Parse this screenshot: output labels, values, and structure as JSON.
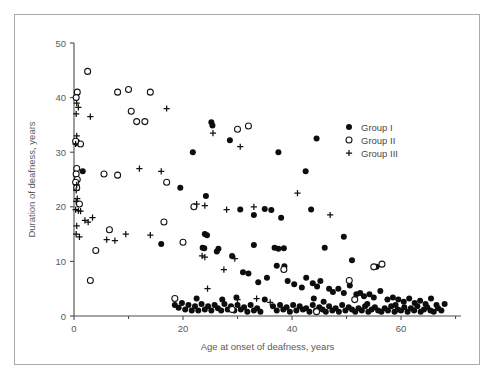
{
  "figure": {
    "background": "#ffffff",
    "frame_color": "#aaaaaa",
    "axis_color": "#4c4c4c",
    "marker_color": "#0d0d0d"
  },
  "legend": {
    "position": "top-right-inside",
    "entries": [
      {
        "label": "Group I",
        "marker": "filled-circle-icon"
      },
      {
        "label": "Group II",
        "marker": "open-circle-icon"
      },
      {
        "label": "Group III",
        "marker": "plus-icon"
      }
    ]
  },
  "chart_data": {
    "type": "scatter",
    "title": "",
    "xlabel": "Age at onset of deafness, years",
    "ylabel": "Duration of deafness, years",
    "xlim": [
      0,
      71
    ],
    "ylim": [
      0,
      50
    ],
    "xticks": [
      0,
      20,
      40,
      60
    ],
    "xticks_minor": [
      10,
      30,
      50,
      70
    ],
    "yticks": [
      0,
      10,
      20,
      30,
      40,
      50
    ],
    "grid": false,
    "legend": [
      "Group I",
      "Group II",
      "Group III"
    ],
    "series": [
      {
        "name": "Group I",
        "marker": "filled-circle",
        "points": [
          [
            1.6,
            26.5
          ],
          [
            16.0,
            13.2
          ],
          [
            21.8,
            30.0
          ],
          [
            19.5,
            23.5
          ],
          [
            25.2,
            35.5
          ],
          [
            25.4,
            34.9
          ],
          [
            28.6,
            32.2
          ],
          [
            37.5,
            30.0
          ],
          [
            44.5,
            32.5
          ],
          [
            42.5,
            26.5
          ],
          [
            24.2,
            22.0
          ],
          [
            30.5,
            19.5
          ],
          [
            33.0,
            18.5
          ],
          [
            35.0,
            19.6
          ],
          [
            36.2,
            19.4
          ],
          [
            38.0,
            18.0
          ],
          [
            43.5,
            19.5
          ],
          [
            46.0,
            12.5
          ],
          [
            49.5,
            14.5
          ],
          [
            51.0,
            10.2
          ],
          [
            55.5,
            9.0
          ],
          [
            33.0,
            13.0
          ],
          [
            36.8,
            12.5
          ],
          [
            37.5,
            12.3
          ],
          [
            38.5,
            12.4
          ],
          [
            29.0,
            11.0
          ],
          [
            26.2,
            11.8
          ],
          [
            24.0,
            15.0
          ],
          [
            24.4,
            14.8
          ],
          [
            26.5,
            12.3
          ],
          [
            23.6,
            12.5
          ],
          [
            23.9,
            12.4
          ],
          [
            31.0,
            8.0
          ],
          [
            32.0,
            7.8
          ],
          [
            33.8,
            6.2
          ],
          [
            35.4,
            7.0
          ],
          [
            37.2,
            9.2
          ],
          [
            38.6,
            9.1
          ],
          [
            39.2,
            6.4
          ],
          [
            40.4,
            5.8
          ],
          [
            41.8,
            5.2
          ],
          [
            42.6,
            7.0
          ],
          [
            43.8,
            6.0
          ],
          [
            44.6,
            5.4
          ],
          [
            45.2,
            6.4
          ],
          [
            46.8,
            5.0
          ],
          [
            47.5,
            4.4
          ],
          [
            48.5,
            5.0
          ],
          [
            49.5,
            4.2
          ],
          [
            50.6,
            5.6
          ],
          [
            51.8,
            4.0
          ],
          [
            52.5,
            4.2
          ],
          [
            53.2,
            3.6
          ],
          [
            54.2,
            4.0
          ],
          [
            55.0,
            3.4
          ],
          [
            56.2,
            4.6
          ],
          [
            57.5,
            3.0
          ],
          [
            58.5,
            3.4
          ],
          [
            59.5,
            3.0
          ],
          [
            60.5,
            2.6
          ],
          [
            61.5,
            3.2
          ],
          [
            62.5,
            2.4
          ],
          [
            63.5,
            2.8
          ],
          [
            64.5,
            2.2
          ],
          [
            65.5,
            3.2
          ],
          [
            66.5,
            2.0
          ],
          [
            18.5,
            2.0
          ],
          [
            19.2,
            1.5
          ],
          [
            19.8,
            2.4
          ],
          [
            20.4,
            1.2
          ],
          [
            21.0,
            2.0
          ],
          [
            21.6,
            1.0
          ],
          [
            22.2,
            1.8
          ],
          [
            22.8,
            1.0
          ],
          [
            23.4,
            2.2
          ],
          [
            24.0,
            1.2
          ],
          [
            24.6,
            1.8
          ],
          [
            25.2,
            1.0
          ],
          [
            25.8,
            2.0
          ],
          [
            26.4,
            1.4
          ],
          [
            27.0,
            1.0
          ],
          [
            27.6,
            2.2
          ],
          [
            28.2,
            1.2
          ],
          [
            28.8,
            1.8
          ],
          [
            29.4,
            1.0
          ],
          [
            30.0,
            2.0
          ],
          [
            30.6,
            1.2
          ],
          [
            31.2,
            1.6
          ],
          [
            31.8,
            0.8
          ],
          [
            32.4,
            2.0
          ],
          [
            33.0,
            1.0
          ],
          [
            33.6,
            1.4
          ],
          [
            34.2,
            0.8
          ],
          [
            36.5,
            1.8
          ],
          [
            37.2,
            1.0
          ],
          [
            37.8,
            2.0
          ],
          [
            38.4,
            1.2
          ],
          [
            39.0,
            1.6
          ],
          [
            39.6,
            0.8
          ],
          [
            40.2,
            2.0
          ],
          [
            40.8,
            1.0
          ],
          [
            41.4,
            1.8
          ],
          [
            42.0,
            1.2
          ],
          [
            42.6,
            1.4
          ],
          [
            43.2,
            0.8
          ],
          [
            43.8,
            2.0
          ],
          [
            44.4,
            1.0
          ],
          [
            45.0,
            1.6
          ],
          [
            45.6,
            1.2
          ],
          [
            46.2,
            0.8
          ],
          [
            46.8,
            1.8
          ],
          [
            47.4,
            1.0
          ],
          [
            48.0,
            1.4
          ],
          [
            48.6,
            0.8
          ],
          [
            49.2,
            2.0
          ],
          [
            49.8,
            1.0
          ],
          [
            50.4,
            1.6
          ],
          [
            51.0,
            1.2
          ],
          [
            51.6,
            0.8
          ],
          [
            52.2,
            1.4
          ],
          [
            52.8,
            1.0
          ],
          [
            53.4,
            1.8
          ],
          [
            54.0,
            0.8
          ],
          [
            54.6,
            1.2
          ],
          [
            55.2,
            1.6
          ],
          [
            55.8,
            1.0
          ],
          [
            56.4,
            0.8
          ],
          [
            57.0,
            1.4
          ],
          [
            57.6,
            1.0
          ],
          [
            58.2,
            1.8
          ],
          [
            58.8,
            0.8
          ],
          [
            59.4,
            1.2
          ],
          [
            60.0,
            1.0
          ],
          [
            60.6,
            1.6
          ],
          [
            61.2,
            0.8
          ],
          [
            61.8,
            1.4
          ],
          [
            62.4,
            1.0
          ],
          [
            63.0,
            1.8
          ],
          [
            63.6,
            0.8
          ],
          [
            64.2,
            1.2
          ],
          [
            64.8,
            1.6
          ],
          [
            65.4,
            1.0
          ],
          [
            66.0,
            0.8
          ],
          [
            66.8,
            1.4
          ],
          [
            67.4,
            1.0
          ],
          [
            68.0,
            2.2
          ],
          [
            35.0,
            3.0
          ],
          [
            29.8,
            3.4
          ],
          [
            27.2,
            3.0
          ],
          [
            22.5,
            3.2
          ],
          [
            44.0,
            3.2
          ],
          [
            45.8,
            2.6
          ],
          [
            53.8,
            2.2
          ],
          [
            59.0,
            2.0
          ]
        ]
      },
      {
        "name": "Group II",
        "marker": "open-circle",
        "points": [
          [
            2.5,
            44.8
          ],
          [
            0.6,
            41.0
          ],
          [
            0.4,
            40.0
          ],
          [
            8.0,
            41.0
          ],
          [
            10.0,
            41.5
          ],
          [
            14.0,
            41.0
          ],
          [
            10.5,
            37.5
          ],
          [
            11.5,
            35.6
          ],
          [
            13.0,
            35.6
          ],
          [
            0.5,
            31.8
          ],
          [
            1.2,
            31.5
          ],
          [
            0.3,
            32.0
          ],
          [
            0.5,
            27.0
          ],
          [
            0.4,
            26.0
          ],
          [
            0.6,
            25.0
          ],
          [
            0.3,
            24.5
          ],
          [
            0.5,
            23.5
          ],
          [
            1.0,
            20.5
          ],
          [
            30.0,
            34.2
          ],
          [
            32.0,
            34.8
          ],
          [
            5.5,
            26.0
          ],
          [
            8.0,
            25.8
          ],
          [
            17.0,
            24.5
          ],
          [
            6.5,
            15.8
          ],
          [
            4.0,
            12.0
          ],
          [
            3.0,
            6.5
          ],
          [
            16.5,
            17.2
          ],
          [
            22.0,
            20.0
          ],
          [
            20.0,
            13.5
          ],
          [
            18.5,
            3.2
          ],
          [
            29.0,
            1.2
          ],
          [
            38.5,
            8.5
          ],
          [
            55.0,
            9.0
          ],
          [
            56.5,
            9.5
          ],
          [
            50.5,
            6.5
          ],
          [
            51.5,
            3.0
          ],
          [
            44.5,
            0.8
          ]
        ]
      },
      {
        "name": "Group III",
        "marker": "plus",
        "points": [
          [
            0.5,
            39.0
          ],
          [
            0.8,
            38.2
          ],
          [
            0.4,
            37.0
          ],
          [
            3.0,
            36.5
          ],
          [
            17.0,
            38.0
          ],
          [
            0.5,
            33.0
          ],
          [
            0.3,
            31.5
          ],
          [
            0.5,
            24.0
          ],
          [
            0.4,
            23.0
          ],
          [
            0.6,
            21.5
          ],
          [
            0.4,
            21.0
          ],
          [
            0.3,
            19.5
          ],
          [
            0.8,
            19.3
          ],
          [
            1.2,
            19.2
          ],
          [
            2.0,
            17.5
          ],
          [
            2.6,
            17.2
          ],
          [
            3.4,
            18.0
          ],
          [
            14.0,
            14.8
          ],
          [
            9.5,
            15.0
          ],
          [
            6.0,
            14.0
          ],
          [
            7.5,
            13.8
          ],
          [
            22.5,
            20.5
          ],
          [
            24.0,
            20.2
          ],
          [
            25.5,
            33.5
          ],
          [
            30.5,
            31.0
          ],
          [
            28.0,
            19.5
          ],
          [
            33.0,
            20.0
          ],
          [
            41.0,
            22.5
          ],
          [
            47.0,
            18.5
          ],
          [
            12.0,
            27.0
          ],
          [
            16.0,
            26.5
          ],
          [
            23.5,
            11.0
          ],
          [
            27.5,
            8.5
          ],
          [
            24.0,
            10.8
          ],
          [
            29.5,
            10.5
          ],
          [
            30.0,
            3.0
          ],
          [
            36.0,
            2.5
          ],
          [
            24.5,
            5.0
          ],
          [
            33.5,
            3.2
          ],
          [
            0.5,
            16.5
          ],
          [
            0.4,
            15.0
          ],
          [
            1.0,
            14.5
          ]
        ]
      }
    ]
  }
}
